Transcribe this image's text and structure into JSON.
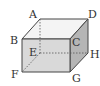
{
  "diagram": {
    "type": "cuboid",
    "vertices": {
      "A": {
        "label": "A"
      },
      "B": {
        "label": "B"
      },
      "C": {
        "label": "C"
      },
      "D": {
        "label": "D"
      },
      "E": {
        "label": "E"
      },
      "F": {
        "label": "F"
      },
      "G": {
        "label": "G"
      },
      "H": {
        "label": "H"
      }
    },
    "colors": {
      "front_face": "#d9d9d9",
      "top_face": "#f4f4f4",
      "side_face": "#b5b5b5",
      "edge": "#444444"
    }
  }
}
